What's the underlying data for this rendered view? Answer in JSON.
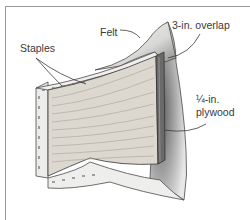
{
  "figure": {
    "labels": {
      "staples": "Staples",
      "felt": "Felt",
      "overlap": "3-in. overlap",
      "plywood_line1": "¼-in.",
      "plywood_line2": "plywood"
    },
    "colors": {
      "frame": "#9a9a9a",
      "wood": "#d9d4cc",
      "wood_grain": "#a9a39a",
      "felt": "#f1f1ef",
      "shadow": "#6f6f6f",
      "edge": "#4a4a4a",
      "text": "#3a3a3a"
    }
  }
}
